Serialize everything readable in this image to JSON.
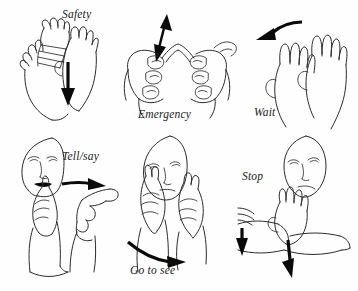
{
  "figure": {
    "title": "",
    "background_color": "#ffffff",
    "ink_color": "#2b2b2b",
    "arrow_color": "#0a0a0a",
    "layout": "2 rows x 3 columns",
    "style": "line-drawing sign language illustrations"
  },
  "panels": [
    {
      "id": "safety",
      "label": "Safety",
      "label_position": "top-center",
      "arrow": {
        "name": "down-arrow",
        "direction": "down"
      },
      "drawing": "two-hands-crossed-wrists-moving-down"
    },
    {
      "id": "emergency",
      "label": "Emergency",
      "label_position": "bottom-center",
      "arrow": {
        "name": "double-arrow-vertical",
        "direction": "up-down"
      },
      "drawing": "two-hands-fingertips-touching-tent-shape"
    },
    {
      "id": "wait",
      "label": "Wait",
      "label_position": "bottom-left",
      "arrow": {
        "name": "curved-arrow-left",
        "direction": "left"
      },
      "drawing": "two-flat-hands-side-by-side"
    },
    {
      "id": "tell-say",
      "label": "Tell/say",
      "label_position": "top-right",
      "arrow": {
        "name": "curved-arrow-right",
        "direction": "right"
      },
      "drawing": "index-finger-at-mouth-moving-outward"
    },
    {
      "id": "go-to-see",
      "label": "Go to see",
      "label_position": "bottom-left",
      "arrow": {
        "name": "curved-arrow-right-down",
        "direction": "right"
      },
      "drawing": "v-hand-at-eyes-moving-forward"
    },
    {
      "id": "stop",
      "label": "Stop",
      "label_position": "upper-left",
      "arrows": [
        {
          "name": "down-arrow-left",
          "direction": "down"
        },
        {
          "name": "down-arrow-right",
          "direction": "down"
        }
      ],
      "drawing": "flat-hand-chopping-onto-forearm"
    }
  ]
}
